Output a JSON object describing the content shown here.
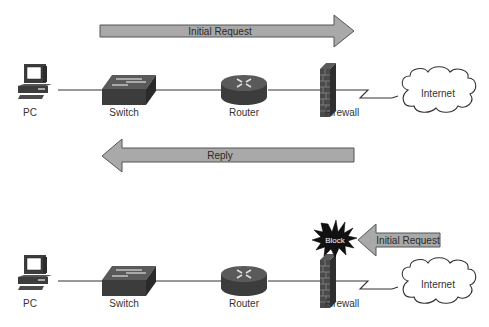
{
  "diagram": {
    "colors": {
      "arrow_fill": "#a9a9a9",
      "arrow_stroke": "#555555",
      "device_dark": "#3c3c3c",
      "line": "#333333",
      "block_burst": "#111111",
      "block_text": "#ffffff"
    },
    "top_scenario": {
      "request_arrow": {
        "label": "Initial Request",
        "direction": "right"
      },
      "reply_arrow": {
        "label": "Reply",
        "direction": "left"
      },
      "devices": {
        "pc": "PC",
        "switch": "Switch",
        "router": "Router",
        "firewall": "Firewall",
        "internet": "Internet"
      }
    },
    "bottom_scenario": {
      "request_arrow": {
        "label": "Initial Request",
        "direction": "left"
      },
      "block_badge": "Block",
      "devices": {
        "pc": "PC",
        "switch": "Switch",
        "router": "Router",
        "firewall": "Firewall",
        "internet": "Internet"
      }
    }
  }
}
